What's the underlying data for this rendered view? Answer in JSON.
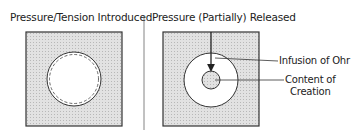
{
  "panels": [
    {
      "title": "Pressure/Tension Introduced"
    },
    {
      "title": "Pressure (Partially) Released"
    }
  ],
  "labels": {
    "infusion": "Infusion of Ohr",
    "content_line1": "Content of",
    "content_line2": "Creation"
  },
  "colors": {
    "fill": "#d6d6d6",
    "stroke": "#333333"
  }
}
